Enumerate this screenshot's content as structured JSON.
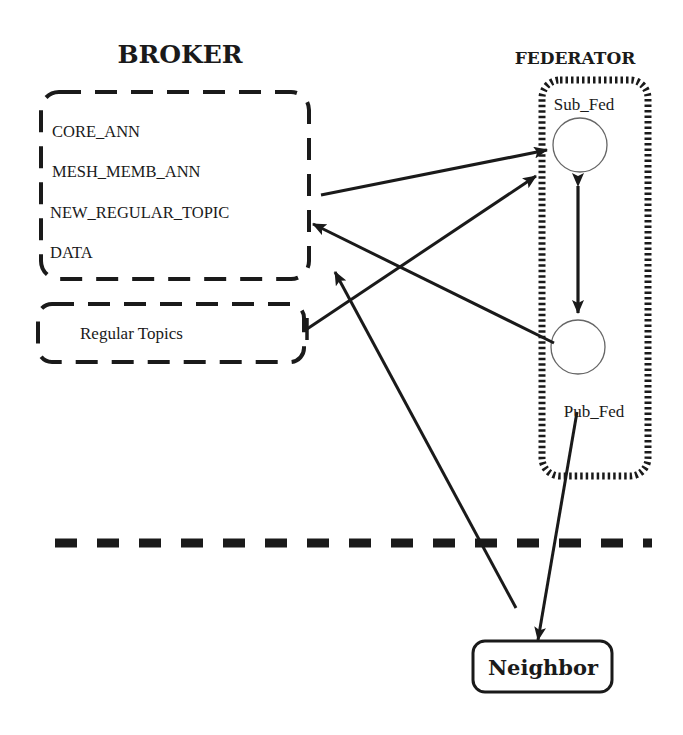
{
  "broker": {
    "title": "BROKER",
    "topics": [
      "CORE_ANN",
      "MESH_MEMB_ANN",
      "NEW_REGULAR_TOPIC",
      "DATA"
    ],
    "regular_topics_label": "Regular Topics"
  },
  "federator": {
    "title": "FEDERATOR",
    "sub_fed_label": "Sub_Fed",
    "pub_fed_label": "Pub_Fed"
  },
  "neighbor": {
    "label": "Neighbor"
  },
  "colors": {
    "ink": "#1a1a1a",
    "background": "#ffffff"
  }
}
